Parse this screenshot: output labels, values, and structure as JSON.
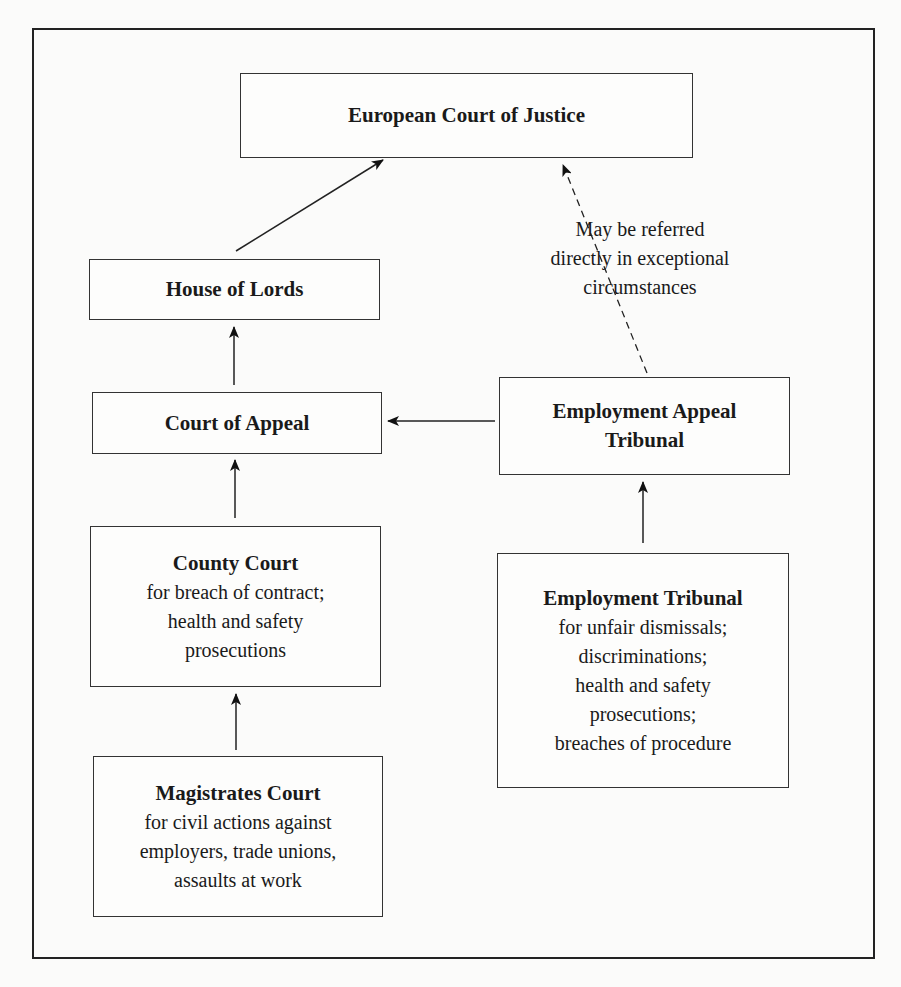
{
  "diagram": {
    "nodes": {
      "ecj": {
        "title": "European Court of Justice",
        "lines": []
      },
      "house_of_lords": {
        "title": "House of Lords",
        "lines": []
      },
      "court_of_appeal": {
        "title": "Court of Appeal",
        "lines": []
      },
      "eat": {
        "title_line1": "Employment Appeal",
        "title_line2": "Tribunal"
      },
      "county_court": {
        "title": "County Court",
        "lines": [
          "for breach of contract;",
          "health and safety",
          "prosecutions"
        ]
      },
      "employment_tribunal": {
        "title": "Employment Tribunal",
        "lines": [
          "for unfair dismissals;",
          "discriminations;",
          "health and safety",
          "prosecutions;",
          "breaches of procedure"
        ]
      },
      "magistrates": {
        "title": "Magistrates Court",
        "lines": [
          "for civil actions against",
          "employers, trade unions,",
          "assaults at work"
        ]
      }
    },
    "note": {
      "lines": [
        "May be referred",
        "directly in exceptional",
        "circumstances"
      ]
    },
    "edges": [
      {
        "from": "house_of_lords",
        "to": "ecj",
        "style": "solid"
      },
      {
        "from": "court_of_appeal",
        "to": "house_of_lords",
        "style": "solid"
      },
      {
        "from": "county_court",
        "to": "court_of_appeal",
        "style": "solid"
      },
      {
        "from": "magistrates",
        "to": "county_court",
        "style": "solid"
      },
      {
        "from": "eat",
        "to": "court_of_appeal",
        "style": "solid"
      },
      {
        "from": "employment_tribunal",
        "to": "eat",
        "style": "solid"
      },
      {
        "from": "eat",
        "to": "ecj",
        "style": "dashed"
      }
    ],
    "colors": {
      "line": "#222222",
      "background": "#fbfbfa"
    }
  }
}
